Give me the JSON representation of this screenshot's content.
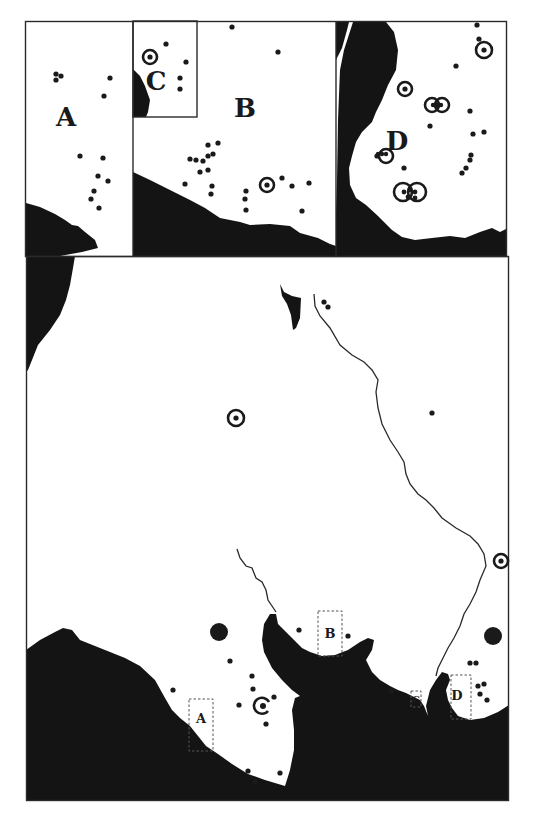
{
  "map": {
    "colors": {
      "sea": "#141414",
      "land": "#ffffff",
      "ink": "#1a1a1a",
      "frame": "#2a2a2a"
    },
    "insets": [
      {
        "id": "A",
        "label": "A",
        "label_pos": [
          66,
          126
        ],
        "font_size": 26
      },
      {
        "id": "B",
        "label": "B",
        "label_pos": [
          245,
          117
        ],
        "font_size": 26
      },
      {
        "id": "C",
        "label": "C",
        "label_pos": [
          156,
          90
        ],
        "font_size": 26
      },
      {
        "id": "D",
        "label": "D",
        "label_pos": [
          397,
          150
        ],
        "font_size": 26
      }
    ],
    "locators": [
      {
        "id": "A",
        "label": "A",
        "box": [
          189,
          699,
          24,
          52
        ],
        "label_pos": [
          201,
          723
        ]
      },
      {
        "id": "B",
        "label": "B",
        "box": [
          318,
          611,
          24,
          45
        ],
        "label_pos": [
          330,
          638
        ]
      },
      {
        "id": "C",
        "label": "C",
        "box": [
          411,
          691,
          10,
          16
        ],
        "label_pos": [
          416,
          703
        ]
      },
      {
        "id": "D",
        "label": "D",
        "box": [
          451,
          675,
          20,
          44
        ],
        "label_pos": [
          457,
          700
        ]
      }
    ],
    "dots": [
      [
        56,
        74
      ],
      [
        61,
        76
      ],
      [
        56,
        80
      ],
      [
        110,
        78
      ],
      [
        104,
        96
      ],
      [
        80,
        156
      ],
      [
        103,
        158
      ],
      [
        98,
        176
      ],
      [
        108,
        181
      ],
      [
        94,
        191
      ],
      [
        91,
        199
      ],
      [
        99,
        208
      ],
      [
        166,
        44
      ],
      [
        186,
        62
      ],
      [
        180,
        78
      ],
      [
        180,
        89
      ],
      [
        232,
        27
      ],
      [
        278,
        52
      ],
      [
        208,
        145
      ],
      [
        218,
        143
      ],
      [
        203,
        161
      ],
      [
        208,
        156
      ],
      [
        213,
        154
      ],
      [
        190,
        159
      ],
      [
        196,
        160
      ],
      [
        200,
        172
      ],
      [
        208,
        170
      ],
      [
        185,
        184
      ],
      [
        212,
        186
      ],
      [
        211,
        194
      ],
      [
        246,
        191
      ],
      [
        245,
        199
      ],
      [
        246,
        210
      ],
      [
        282,
        178
      ],
      [
        292,
        186
      ],
      [
        309,
        183
      ],
      [
        302,
        211
      ],
      [
        477,
        25
      ],
      [
        479,
        39
      ],
      [
        456,
        66
      ],
      [
        470,
        111
      ],
      [
        430,
        126
      ],
      [
        473,
        134
      ],
      [
        484,
        132
      ],
      [
        377,
        156
      ],
      [
        404,
        168
      ],
      [
        462,
        173
      ],
      [
        466,
        168
      ],
      [
        470,
        160
      ],
      [
        471,
        155
      ],
      [
        324,
        302
      ],
      [
        328,
        307
      ],
      [
        432,
        413
      ],
      [
        299,
        630
      ],
      [
        348,
        636
      ],
      [
        230,
        661
      ],
      [
        252,
        676
      ],
      [
        253,
        689
      ],
      [
        239,
        705
      ],
      [
        274,
        697
      ],
      [
        266,
        724
      ],
      [
        248,
        771
      ],
      [
        255,
        782
      ],
      [
        280,
        773
      ],
      [
        392,
        691
      ],
      [
        470,
        663
      ],
      [
        476,
        663
      ],
      [
        478,
        686
      ],
      [
        484,
        684
      ],
      [
        480,
        694
      ],
      [
        487,
        700
      ],
      [
        173,
        690
      ]
    ],
    "rings": [
      {
        "pos": [
          150,
          57
        ],
        "r": 7
      },
      {
        "pos": [
          267,
          185
        ],
        "r": 7
      },
      {
        "pos": [
          405,
          89
        ],
        "r": 7
      },
      {
        "pos": [
          484,
          50
        ],
        "r": 8
      },
      {
        "pos": [
          236,
          418
        ],
        "r": 8
      },
      {
        "pos": [
          501,
          561
        ],
        "r": 7
      }
    ],
    "pairs": [
      {
        "pos": [
          437,
          105
        ],
        "label": "double-ring"
      },
      {
        "pos": [
          386,
          156
        ],
        "label": "single-ring-dots"
      },
      {
        "pos": [
          410,
          192
        ],
        "label": "double-ring-large"
      }
    ],
    "big_circles": [
      {
        "pos": [
          219,
          632
        ],
        "r": 9
      },
      {
        "pos": [
          493,
          636
        ],
        "r": 9
      }
    ],
    "spiral_marker": {
      "pos": [
        262,
        706
      ]
    }
  }
}
